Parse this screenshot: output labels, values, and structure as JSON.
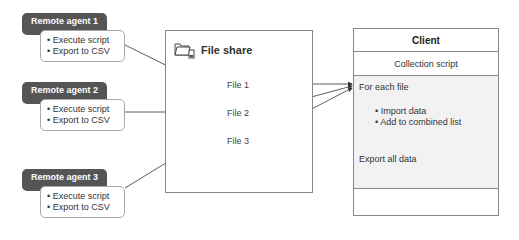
{
  "agents": [
    {
      "title": "Remote agent 1",
      "items": [
        "• Execute script",
        "• Export to CSV"
      ]
    },
    {
      "title": "Remote agent 2",
      "items": [
        "• Execute script",
        "• Export to CSV"
      ]
    },
    {
      "title": "Remote agent 3",
      "items": [
        "• Execute script",
        "• Export to CSV"
      ]
    }
  ],
  "file_share": {
    "title": "File share",
    "icon": "folder-share-icon",
    "files": [
      "File 1",
      "File 2",
      "File 3"
    ]
  },
  "client": {
    "title": "Client",
    "script": "Collection script",
    "loop_label": "For each file",
    "loop_items": [
      "• Import data",
      "• Add to combined list"
    ],
    "final_step": "Export all data"
  },
  "colors": {
    "agent_header": "#555555",
    "client_body": "#f2f2f2",
    "border": "#888888"
  }
}
